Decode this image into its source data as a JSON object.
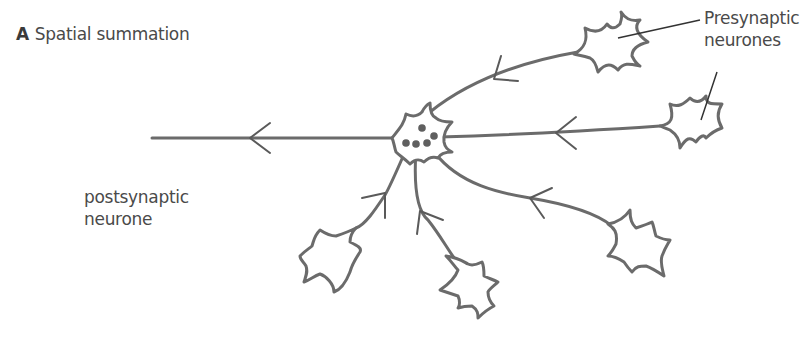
{
  "figure": {
    "panel_letter": "A",
    "title": "Spatial summation"
  },
  "labels": {
    "presynaptic": [
      "Presynaptic",
      "neurones"
    ],
    "postsynaptic": [
      "postsynaptic",
      "neurone"
    ]
  },
  "diagram": {
    "postsynaptic_neurone_count": 1,
    "presynaptic_neurone_count": 5,
    "synaptic_knob_count": 5,
    "signal_direction": "presynaptic-to-postsynaptic",
    "colors": {
      "line": "#6b6b6b",
      "text": "#4a4a4a",
      "background": "#ffffff"
    }
  }
}
